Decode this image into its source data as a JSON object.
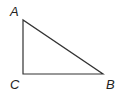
{
  "diagram": {
    "type": "right-triangle",
    "stroke_color": "#333333",
    "label_color": "#222222",
    "vertices": [
      {
        "name": "A",
        "x": 23,
        "y": 20,
        "label_x": 10,
        "label_y": 16
      },
      {
        "name": "C",
        "x": 23,
        "y": 74,
        "label_x": 10,
        "label_y": 89
      },
      {
        "name": "B",
        "x": 103,
        "y": 74,
        "label_x": 106,
        "label_y": 89
      }
    ],
    "labels": {
      "A": "A",
      "B": "B",
      "C": "C"
    },
    "right_angle_at": "C"
  }
}
